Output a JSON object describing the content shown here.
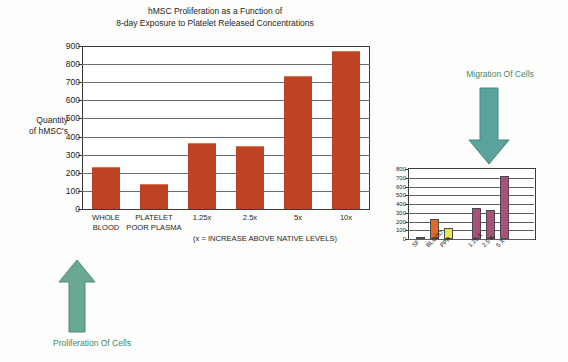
{
  "figure": {
    "background_color": "#fdfdfb",
    "accent_color": "#3f8a6e"
  },
  "annotations": {
    "proliferation": {
      "label": "Proliferation Of Cells",
      "arrow": "up-arrow-icon",
      "color": "#3f8a6e"
    },
    "migration": {
      "label": "Migration Of Cells",
      "arrow": "down-arrow-icon",
      "color": "#3f8a6e"
    }
  },
  "chart_data": [
    {
      "id": "main",
      "type": "bar",
      "title": "hMSC Proliferation as a Function of\n8-day Exposure to Platelet Released Concentrations",
      "title_line1": "hMSC Proliferation as a Function of",
      "title_line2": "8-day Exposure to Platelet Released Concentrations",
      "xlabel": "(x = INCREASE ABOVE NATIVE LEVELS)",
      "ylabel": "Quantity of hMSC's",
      "ylabel_line1": "Quantity",
      "ylabel_line2": "of hMSC's",
      "categories": [
        "WHOLE BLOOD",
        "PLATELET POOR PLASMA",
        "1.25x",
        "2.5x",
        "5x",
        "10x"
      ],
      "category_lines": [
        [
          "WHOLE",
          "BLOOD"
        ],
        [
          "PLATELET",
          "POOR PLASMA"
        ],
        [
          "1.25x",
          ""
        ],
        [
          "2.5x",
          ""
        ],
        [
          "5x",
          ""
        ],
        [
          "10x",
          ""
        ]
      ],
      "values": [
        225,
        135,
        360,
        340,
        730,
        865
      ],
      "bar_color": "#bf4227",
      "ylim": [
        0,
        900
      ],
      "yticks": [
        900,
        800,
        700,
        600,
        500,
        400,
        300,
        200,
        100,
        0
      ],
      "grid": true,
      "legend": "none"
    },
    {
      "id": "inset",
      "type": "bar",
      "title": "",
      "xlabel": "",
      "ylabel": "",
      "categories": [
        "SF",
        "BLOOD",
        "PPP",
        "1.25 X",
        "2.5 X",
        "5 X"
      ],
      "values": [
        8,
        225,
        125,
        360,
        335,
        725
      ],
      "bar_colors": [
        "#d94f2a",
        "#e06a28",
        "#e8e84a",
        "#a8527a",
        "#a8527a",
        "#a8527a"
      ],
      "ylim": [
        0,
        800
      ],
      "yticks": [
        800,
        700,
        600,
        500,
        400,
        300,
        200,
        100,
        0
      ],
      "grid": true,
      "legend": "none"
    }
  ]
}
